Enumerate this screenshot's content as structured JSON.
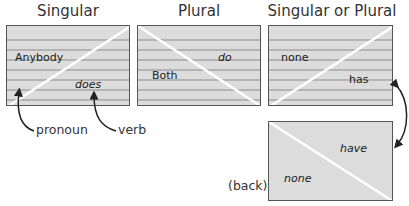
{
  "titles": {
    "singular": "Singular",
    "plural": "Plural",
    "either": "Singular or Plural"
  },
  "cards": {
    "singular": {
      "front_word": "Anybody",
      "back_word": "does"
    },
    "plural": {
      "front_word": "Both",
      "back_word": "do"
    },
    "either_front": {
      "top_word": "none",
      "bottom_word": "has"
    },
    "either_back": {
      "top_word": "have",
      "bottom_word": "none"
    }
  },
  "annotations": {
    "pronoun": "pronoun",
    "verb": "verb",
    "back": "(back)"
  },
  "colors": {
    "card_fill": "#dcdcdc",
    "card_border": "#555555",
    "ruled_line": "#8c8c8c",
    "diagonal": "#ffffff"
  }
}
